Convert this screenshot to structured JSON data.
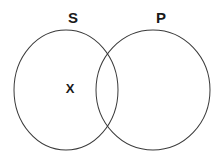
{
  "diagram": {
    "type": "venn-diagram",
    "background_color": "#ffffff",
    "stroke_color": "#3a3a3a",
    "text_color": "#1a1a1a",
    "sets": [
      {
        "id": "s",
        "label": "S",
        "center_x": 66,
        "center_y": 90,
        "radius_x": 52,
        "radius_y": 60
      },
      {
        "id": "p",
        "label": "P",
        "center_x": 153,
        "center_y": 90,
        "radius_x": 57,
        "radius_y": 60
      }
    ],
    "marks": [
      {
        "id": "x-mark",
        "symbol": "X",
        "region": "s-only",
        "x": 70,
        "y": 89
      }
    ],
    "intersections": [
      {
        "x": 113,
        "y": 48
      },
      {
        "x": 113,
        "y": 135
      }
    ]
  }
}
